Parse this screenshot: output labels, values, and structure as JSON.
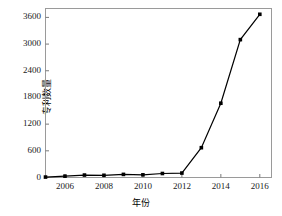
{
  "chart_data": {
    "type": "line",
    "title": "",
    "xlabel": "年份",
    "ylabel": "专利数量",
    "x": [
      2005,
      2006,
      2007,
      2008,
      2009,
      2010,
      2011,
      2012,
      2013,
      2014,
      2015,
      2016
    ],
    "values": [
      10,
      30,
      55,
      50,
      70,
      60,
      90,
      100,
      670,
      1670,
      3100,
      3670
    ],
    "series": [
      {
        "name": "专利数量",
        "values": [
          10,
          30,
          55,
          50,
          70,
          60,
          90,
          100,
          670,
          1670,
          3100,
          3670
        ]
      }
    ],
    "xlim": [
      2005,
      2016.6
    ],
    "ylim": [
      0,
      3800
    ],
    "xticks": [
      2006,
      2008,
      2010,
      2012,
      2014,
      2016
    ],
    "xtick_labels": [
      "2006",
      "2008",
      "2010",
      "2012",
      "2014",
      "2016"
    ],
    "yticks": [
      0,
      600,
      1200,
      1800,
      2400,
      3000,
      3600
    ],
    "ytick_labels": [
      "0",
      "600",
      "1200",
      "1800",
      "2400",
      "3000",
      "3600"
    ],
    "grid": false,
    "legend": "none",
    "marker": "square",
    "line_color": "#000000",
    "marker_color": "#000000",
    "frame_color": "#808080",
    "background": "#ffffff"
  }
}
